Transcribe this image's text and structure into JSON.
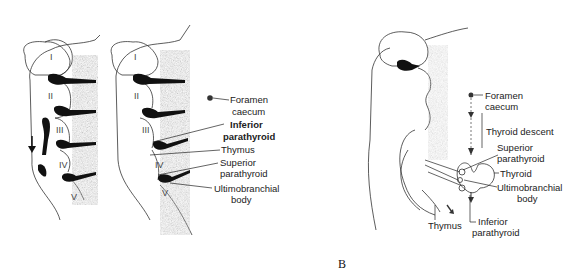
{
  "figure": {
    "panel_label": "B",
    "left_diagram_1": {
      "arch_numerals": [
        "I",
        "II",
        "III",
        "IV",
        "V"
      ]
    },
    "left_diagram_2": {
      "arch_numerals": [
        "I",
        "II",
        "III",
        "IV",
        "V"
      ],
      "labels": {
        "foramen_caecum": [
          "Foramen",
          "caecum"
        ],
        "inferior_parathyroid": [
          "Inferior",
          "parathyroid"
        ],
        "thymus": "Thymus",
        "superior_parathyroid": [
          "Superior",
          "parathyroid"
        ],
        "ultimobranchial_body": [
          "Ultimobranchial",
          "body"
        ]
      }
    },
    "right_diagram": {
      "labels": {
        "foramen_caecum": [
          "Foramen",
          "caecum"
        ],
        "thyroid_descent": "Thyroid descent",
        "superior_parathyroid": [
          "Superior",
          "parathyroid"
        ],
        "thyroid": "Thyroid",
        "ultimobranchial_body": [
          "Ultimobranchial",
          "body"
        ],
        "thymus": "Thymus",
        "inferior_parathyroid": [
          "Inferior",
          "parathyroid"
        ]
      }
    },
    "colors": {
      "ink": "#111111",
      "shading": "#555555",
      "background": "#ffffff"
    }
  }
}
